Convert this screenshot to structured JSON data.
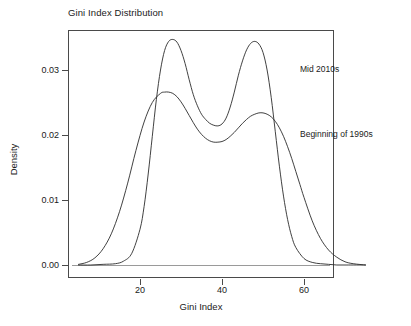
{
  "chart_data": {
    "type": "line",
    "title": "Gini Index Distribution",
    "xlabel": "Gini Index",
    "ylabel": "Density",
    "xlim": [
      5,
      75
    ],
    "ylim": [
      0,
      0.0365
    ],
    "grid": false,
    "legend_position": "inline-annotations",
    "xticks": [
      20,
      40,
      60
    ],
    "xtick_labels": [
      "20",
      "40",
      "60"
    ],
    "yticks": [
      0.0,
      0.01,
      0.02,
      0.03
    ],
    "ytick_labels": [
      "0.00",
      "0.01",
      "0.02",
      "0.03"
    ],
    "annotations": [
      {
        "text": "Mid 2010s",
        "x": 60,
        "y": 0.0308
      },
      {
        "text": "Beginning of 1990s",
        "x": 60,
        "y": 0.0208
      }
    ],
    "series": [
      {
        "name": "Mid 2010s",
        "x": [
          5,
          8,
          11,
          14,
          16,
          18,
          20,
          21,
          22,
          23,
          24,
          25,
          26,
          27,
          28,
          29,
          30,
          31,
          32,
          33,
          34,
          35,
          36,
          37,
          38,
          39,
          40,
          41,
          42,
          43,
          44,
          45,
          46,
          47,
          48,
          49,
          50,
          51,
          52,
          53,
          54,
          55,
          56,
          57,
          58,
          60,
          62,
          64,
          66,
          68,
          70,
          72,
          75
        ],
        "y": [
          0.0,
          0.0,
          0.0001,
          0.0002,
          0.0006,
          0.0018,
          0.0055,
          0.009,
          0.014,
          0.0198,
          0.0255,
          0.03,
          0.033,
          0.0344,
          0.0347,
          0.0343,
          0.033,
          0.031,
          0.0285,
          0.0262,
          0.0245,
          0.0232,
          0.0224,
          0.0218,
          0.0215,
          0.0214,
          0.0217,
          0.0226,
          0.0243,
          0.0266,
          0.0292,
          0.0314,
          0.0331,
          0.0341,
          0.0344,
          0.034,
          0.0327,
          0.03,
          0.0258,
          0.0205,
          0.0152,
          0.0106,
          0.007,
          0.0044,
          0.0027,
          0.001,
          0.0004,
          0.0002,
          0.0001,
          0.0,
          0.0,
          0.0,
          0.0
        ]
      },
      {
        "name": "Beginning of 1990s",
        "x": [
          5,
          7,
          9,
          11,
          13,
          15,
          17,
          19,
          21,
          23,
          25,
          26,
          27,
          28,
          29,
          30,
          31,
          32,
          33,
          34,
          35,
          36,
          37,
          38,
          39,
          40,
          41,
          42,
          43,
          44,
          45,
          46,
          47,
          48,
          49,
          50,
          51,
          52,
          53,
          54,
          55,
          56,
          57,
          58,
          59,
          60,
          62,
          64,
          66,
          68,
          70,
          72,
          75
        ],
        "y": [
          0.0001,
          0.0004,
          0.0011,
          0.0025,
          0.0048,
          0.0082,
          0.0126,
          0.0176,
          0.022,
          0.025,
          0.0264,
          0.0266,
          0.0266,
          0.0264,
          0.0259,
          0.0251,
          0.0241,
          0.023,
          0.0219,
          0.0209,
          0.0201,
          0.0195,
          0.0191,
          0.0189,
          0.0189,
          0.019,
          0.0193,
          0.0198,
          0.0204,
          0.0211,
          0.0218,
          0.0224,
          0.0229,
          0.0232,
          0.0234,
          0.0234,
          0.0232,
          0.0228,
          0.0221,
          0.0211,
          0.0198,
          0.0182,
          0.0164,
          0.0144,
          0.0124,
          0.0104,
          0.0068,
          0.0041,
          0.0023,
          0.0012,
          0.0005,
          0.0002,
          0.0
        ]
      }
    ]
  },
  "axes": {
    "x_title": "Gini Index",
    "y_title": "Density"
  }
}
